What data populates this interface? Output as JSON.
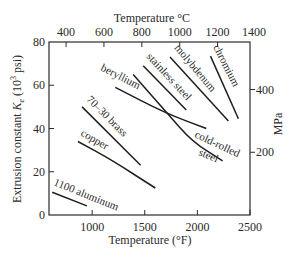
{
  "chart_data": {
    "type": "line",
    "title": "",
    "xlabel": "Temperature (°F)",
    "ylabel": "Extrusion constant K_e (10^3 psi)",
    "ylabel_parts": {
      "main": "Extrusion constant ",
      "symbol": "K",
      "sub": "e",
      "pre_unit": " (10",
      "sup": "3",
      "post_unit": " psi)"
    },
    "xlabel_top": "Temperature °C",
    "ylabel_right": "MPa",
    "xlim": [
      590,
      2500
    ],
    "ylim": [
      0,
      80
    ],
    "grid": false,
    "legend": "inline labels",
    "x_ticks": [
      1000,
      1500,
      2000,
      2500
    ],
    "x_tick_labels": [
      "1000",
      "1500",
      "2000",
      "2500"
    ],
    "y_ticks": [
      0,
      20,
      40,
      60,
      80
    ],
    "y_tick_labels": [
      "0",
      "20",
      "40",
      "60",
      "80"
    ],
    "top_ticks_C": [
      400,
      600,
      800,
      1000,
      1200,
      1400
    ],
    "top_tick_labels": [
      "400",
      "600",
      "800",
      "1000",
      "1200",
      "1400"
    ],
    "right_ticks_MPa": [
      200,
      400
    ],
    "right_tick_labels": [
      "200",
      "400"
    ],
    "series": [
      {
        "name": "1100 aluminum",
        "x": [
          620,
          950
        ],
        "y": [
          10.5,
          4.2
        ]
      },
      {
        "name": "copper",
        "x": [
          865,
          1200,
          1600
        ],
        "y": [
          34,
          25,
          12.5
        ]
      },
      {
        "name": "70-30 brass",
        "x": [
          905,
          1460
        ],
        "y": [
          50,
          23
        ]
      },
      {
        "name": "beryllium",
        "x": [
          1220,
          1700,
          2085
        ],
        "y": [
          59,
          47,
          40
        ]
      },
      {
        "name": "cold-rolled steel",
        "x": [
          1390,
          1715,
          1950,
          2240
        ],
        "y": [
          65,
          47,
          34,
          25
        ]
      },
      {
        "name": "stainless steel",
        "x": [
          1485,
          1895
        ],
        "y": [
          69,
          48.5
        ]
      },
      {
        "name": "molybdenum",
        "x": [
          1740,
          2295
        ],
        "y": [
          73,
          43.5
        ]
      },
      {
        "name": "chromium",
        "x": [
          2125,
          2390
        ],
        "y": [
          73.5,
          44.5
        ]
      }
    ]
  },
  "labels": {
    "aluminum": "1100 aluminum",
    "copper": "copper",
    "brass": "70–30 brass",
    "beryllium": "beryllium",
    "stainless": "stainless steel",
    "molybdenum": "molybdenum",
    "chromium": "chromium",
    "cold_rolled_1": "cold-rolled",
    "cold_rolled_2": "steel"
  }
}
